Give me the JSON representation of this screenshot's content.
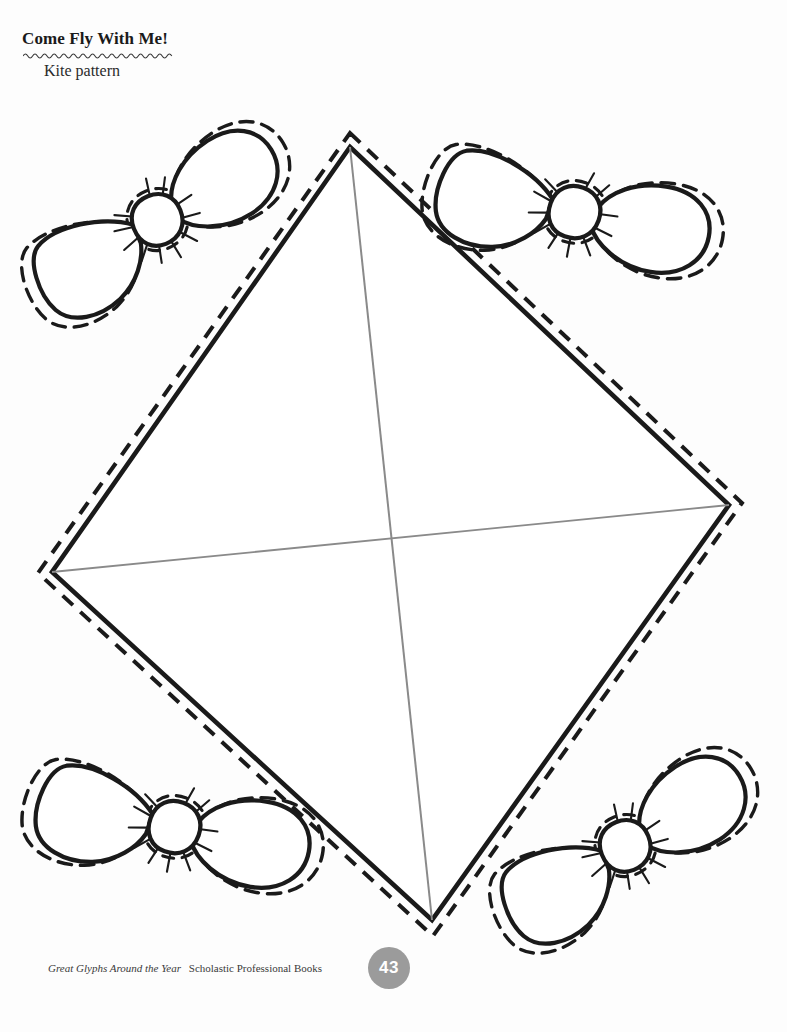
{
  "page": {
    "width": 787,
    "height": 1032,
    "background_color": "#fdfdfd",
    "ink_color": "#1a1a1a",
    "spar_color": "#8a8a8a",
    "badge_color": "#9b9b9b"
  },
  "header": {
    "title": "Come Fly With Me!",
    "subtitle": "Kite pattern",
    "squiggle_name": "wavy-rule"
  },
  "footer": {
    "book_title": "Great Glyphs Around the Year",
    "publisher": "Scholastic Professional Books",
    "page_number": "43"
  },
  "artwork": {
    "description": "Kite pattern cut-out page: one large diamond kite with cross spars and four bow ties",
    "kite": {
      "name": "kite-diamond",
      "points": {
        "top": [
          350,
          147
        ],
        "right": [
          729,
          505
        ],
        "bottom": [
          432,
          920
        ],
        "left": [
          52,
          572
        ]
      },
      "solid_line_width": 4,
      "dash_offset": 11,
      "dash_pattern": "13 9",
      "spars": [
        {
          "name": "vertical-spar",
          "from": [
            350,
            147
          ],
          "to": [
            432,
            920
          ]
        },
        {
          "name": "horizontal-spar",
          "from": [
            52,
            572
          ],
          "to": [
            729,
            505
          ]
        }
      ]
    },
    "bows": [
      {
        "name": "bow-top-left",
        "cx": 156,
        "cy": 222,
        "rotation": -22,
        "scale": 1.0
      },
      {
        "name": "bow-top-right",
        "cx": 572,
        "cy": 213,
        "rotation": 20,
        "scale": 1.02
      },
      {
        "name": "bow-bottom-left",
        "cx": 172,
        "cy": 828,
        "rotation": 20,
        "scale": 1.02
      },
      {
        "name": "bow-bottom-right",
        "cx": 624,
        "cy": 848,
        "rotation": -22,
        "scale": 1.0
      }
    ]
  }
}
